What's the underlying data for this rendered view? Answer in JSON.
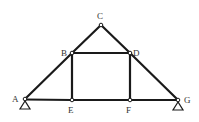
{
  "diagram": {
    "type": "truss",
    "nodes": [
      {
        "id": "A",
        "label": "A",
        "x": 25,
        "y": 99
      },
      {
        "id": "B",
        "label": "B",
        "x": 72,
        "y": 53
      },
      {
        "id": "C",
        "label": "C",
        "x": 101,
        "y": 25
      },
      {
        "id": "D",
        "label": "D",
        "x": 130,
        "y": 53
      },
      {
        "id": "E",
        "label": "E",
        "x": 72,
        "y": 100
      },
      {
        "id": "F",
        "label": "F",
        "x": 130,
        "y": 100
      },
      {
        "id": "G",
        "label": "G",
        "x": 178,
        "y": 100
      }
    ],
    "members": [
      [
        "A",
        "B"
      ],
      [
        "B",
        "C"
      ],
      [
        "C",
        "D"
      ],
      [
        "D",
        "G"
      ],
      [
        "A",
        "E"
      ],
      [
        "E",
        "F"
      ],
      [
        "F",
        "G"
      ],
      [
        "B",
        "E"
      ],
      [
        "D",
        "F"
      ],
      [
        "B",
        "D"
      ]
    ],
    "supports": [
      "A",
      "G"
    ],
    "labels": {
      "A": "A",
      "B": "B",
      "C": "C",
      "D": "D",
      "E": "E",
      "F": "F",
      "G": "G"
    }
  }
}
